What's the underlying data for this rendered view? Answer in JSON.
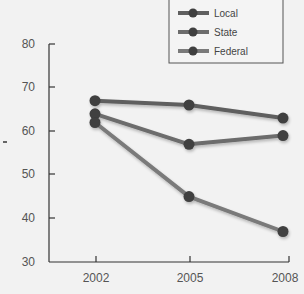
{
  "chart_data": {
    "type": "line",
    "title": "",
    "xlabel": "",
    "ylabel": "",
    "categories": [
      "2002",
      "2005",
      "2008"
    ],
    "series": [
      {
        "name": "Local",
        "values": [
          67,
          66,
          63
        ],
        "color": "#5f5f5f"
      },
      {
        "name": "State",
        "values": [
          64,
          57,
          59
        ],
        "color": "#6c6c6c"
      },
      {
        "name": "Federal",
        "values": [
          62,
          45,
          37
        ],
        "color": "#7a7a7a"
      }
    ],
    "ylim": [
      30,
      80
    ],
    "yticks": [
      "30",
      "40",
      "50",
      "60",
      "70",
      "80"
    ],
    "grid": false,
    "legend_position": "top-right",
    "marker_color": "#3f3f3f"
  },
  "legend": {
    "items": [
      "Local",
      "State",
      "Federal"
    ]
  },
  "axis": {
    "y_ticks": [
      "80",
      "70",
      "60",
      "50",
      "40",
      "30"
    ],
    "x_ticks": [
      "2002",
      "2005",
      "2008"
    ]
  }
}
